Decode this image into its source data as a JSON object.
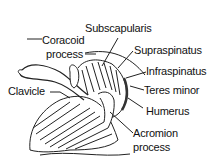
{
  "diagram": {
    "labels": [
      {
        "id": "subscapularis",
        "text": "Subscapularis"
      },
      {
        "id": "coracoid",
        "line1": "Coracoid",
        "line2": "process"
      },
      {
        "id": "supraspinatus",
        "text": "Supraspinatus"
      },
      {
        "id": "infraspinatus",
        "text": "Infraspinatus"
      },
      {
        "id": "clavicle",
        "text": "Clavicle"
      },
      {
        "id": "teres-minor",
        "text": "Teres minor"
      },
      {
        "id": "humerus",
        "text": "Humerus"
      },
      {
        "id": "acromion",
        "line1": "Acromion",
        "line2": "process"
      }
    ]
  }
}
